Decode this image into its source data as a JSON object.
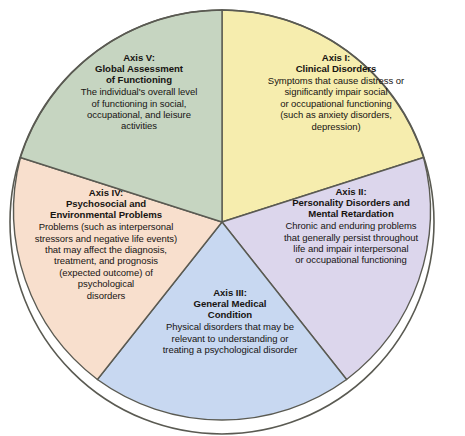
{
  "figure": {
    "type": "pie-diagram",
    "shape": "circle",
    "segment_count": 5,
    "outline_color": "#5a5a52",
    "text_color": "#171412",
    "background": "#ffffff"
  },
  "chart_data": {
    "type": "pie",
    "title": "",
    "xlabel": "",
    "ylabel": "",
    "legend_position": "none",
    "grid": false,
    "categories": [
      "Axis I: Clinical Disorders",
      "Axis II: Personality Disorders and Mental Retardation",
      "Axis III: General Medical Condition",
      "Axis IV: Psychosocial and Environmental Problems",
      "Axis V: Global Assessment of Functioning"
    ],
    "values": [
      20,
      20,
      20,
      20,
      20
    ],
    "colors": [
      "#F6EDAE",
      "#DCD6EC",
      "#C8D8F1",
      "#F8DFCD",
      "#C6D5C1"
    ],
    "start_angle_deg": 0,
    "direction": "clockwise"
  },
  "segments": [
    {
      "id": "axis1",
      "color": "#F6EDAE",
      "title_lines": [
        "Axis I:",
        "Clinical Disorders"
      ],
      "body_lines": [
        "Symptoms that cause distress or",
        "significantly impair social",
        "or occupational functioning",
        "(such as anxiety disorders,",
        "depression)"
      ]
    },
    {
      "id": "axis2",
      "color": "#DCD6EC",
      "title_lines": [
        "Axis II:",
        "Personality Disorders and",
        "Mental Retardation"
      ],
      "body_lines": [
        "Chronic and enduring problems",
        "that generally persist throughout",
        "life and impair interpersonal",
        "or occupational functioning"
      ]
    },
    {
      "id": "axis3",
      "color": "#C8D8F1",
      "title_lines": [
        "Axis III:",
        "General Medical",
        "Condition"
      ],
      "body_lines": [
        "Physical disorders that may be",
        "relevant to understanding or",
        "treating a psychological disorder"
      ]
    },
    {
      "id": "axis4",
      "color": "#F8DFCD",
      "title_lines": [
        "Axis IV:",
        "Psychosocial and",
        "Environmental Problems"
      ],
      "body_lines": [
        "Problems (such as interpersonal",
        "stressors and negative life events)",
        "that may affect the diagnosis,",
        "treatment, and prognosis",
        "(expected outcome) of",
        "psychological",
        "disorders"
      ]
    },
    {
      "id": "axis5",
      "color": "#C6D5C1",
      "title_lines": [
        "Axis V:",
        "Global Assessment",
        "of Functioning"
      ],
      "body_lines": [
        "The individual's overall level",
        "of functioning in social,",
        "occupational, and leisure",
        "activities"
      ]
    }
  ]
}
